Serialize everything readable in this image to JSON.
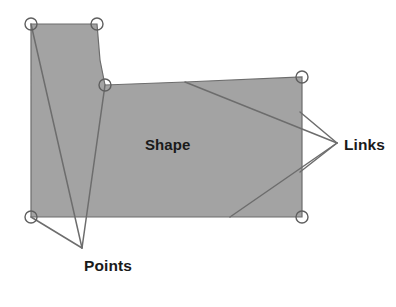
{
  "figure": {
    "background_color": "#ffffff",
    "shape_fill_color": "#a3a3a3",
    "shape_stroke_color": "#6d6d6d",
    "leader_line_color": "#6d6d6d",
    "handle_stroke_color": "#5f5f5f",
    "label_color": "#1a1a1a"
  },
  "labels": {
    "shape": "Shape",
    "points": "Points",
    "links": "Links"
  },
  "geometry": {
    "polygon_points": "31,24 97,24 100,60 105,85 185,82 302,77 302,217 31,217",
    "vertex_handles": [
      {
        "name": "top-left",
        "cx": 31,
        "cy": 24,
        "r": 6
      },
      {
        "name": "top-right-notch",
        "cx": 97,
        "cy": 24,
        "r": 6
      },
      {
        "name": "inner-notch-corner",
        "cx": 105,
        "cy": 85,
        "r": 6
      },
      {
        "name": "top-right",
        "cx": 302,
        "cy": 77,
        "r": 6
      },
      {
        "name": "bottom-left",
        "cx": 31,
        "cy": 217,
        "r": 6
      },
      {
        "name": "bottom-right",
        "cx": 302,
        "cy": 217,
        "r": 6
      }
    ],
    "points_leader_lines": [
      "M31,24 L82,248",
      "M105,85 L82,248",
      "M31,217 L82,248"
    ],
    "links_leader_lines": [
      "M185,82 L337,143",
      "M300,112 L337,143",
      "M300,172 L337,143",
      "M230,217 L337,143"
    ],
    "label_positions": {
      "shape": {
        "x": 145,
        "y": 150
      },
      "points": {
        "x": 84,
        "y": 271
      },
      "links": {
        "x": 344,
        "y": 150
      }
    }
  }
}
